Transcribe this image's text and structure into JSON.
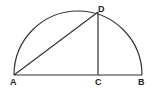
{
  "diagram": {
    "type": "geometry",
    "colors": {
      "stroke": "#333333",
      "label": "#222222",
      "background": "#ffffff"
    },
    "points": {
      "A": {
        "label": "A",
        "x": 14,
        "y": 75
      },
      "B": {
        "label": "B",
        "x": 142,
        "y": 75
      },
      "C": {
        "label": "C",
        "x": 98,
        "y": 75
      },
      "D": {
        "label": "D",
        "x": 98,
        "y": 12
      }
    },
    "segments": [
      {
        "from": "A",
        "to": "B"
      },
      {
        "from": "A",
        "to": "D"
      },
      {
        "from": "D",
        "to": "C"
      }
    ],
    "arc": {
      "from": "A",
      "to": "B",
      "center": [
        78,
        75
      ],
      "radius": 64
    }
  }
}
